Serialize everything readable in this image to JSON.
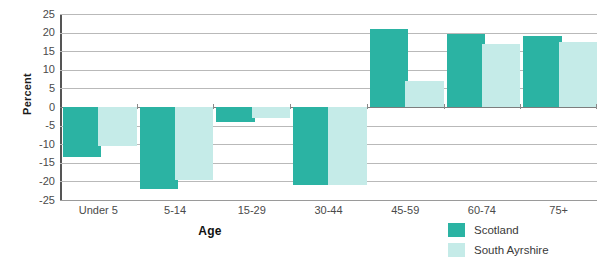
{
  "chart_data": {
    "type": "bar",
    "title": "",
    "xlabel": "Age",
    "ylabel": "Percent",
    "ylim": [
      -25,
      25
    ],
    "yticks": [
      25,
      20,
      15,
      10,
      5,
      0,
      -5,
      -10,
      -15,
      -20,
      -25
    ],
    "ytick_labels": [
      "25",
      "20",
      "15",
      "10",
      "5",
      "0",
      "-5",
      "-10",
      "-15",
      "-20",
      "-25"
    ],
    "grid": true,
    "legend_position": "bottom-right",
    "categories": [
      "Under 5",
      "5-14",
      "15-29",
      "30-44",
      "45-59",
      "60-74",
      "75+"
    ],
    "series": [
      {
        "name": "Scotland",
        "color": "#2BB3A3",
        "values": [
          -13.5,
          -22,
          -4,
          -21,
          21,
          19.5,
          19
        ]
      },
      {
        "name": "South Ayrshire",
        "color": "#C5EBE8",
        "values": [
          -10.5,
          -19.5,
          -3,
          -21,
          7,
          17,
          17.5
        ]
      }
    ]
  },
  "colors": {
    "scotland": "#2BB3A3",
    "south_ayrshire": "#C5EBE8",
    "gridline": "#b9b9b9",
    "axis": "#555555",
    "text": "#404040",
    "background": "#ffffff"
  }
}
